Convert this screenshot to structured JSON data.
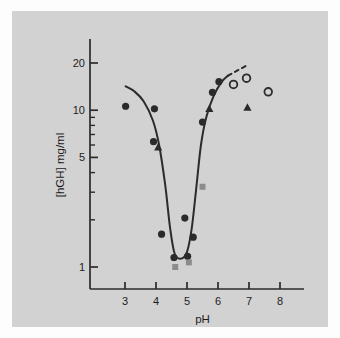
{
  "figure": {
    "background_color": "#fdfdfd",
    "panel_color": "#d2d2d2",
    "ink_color": "#2b2b2b"
  },
  "chart_data": {
    "type": "scatter",
    "title": "",
    "subtitle": "",
    "xlabel": "pH",
    "ylabel": "[hGH] mg/ml",
    "xlim": [
      2.6,
      8.4
    ],
    "ylim": [
      0.85,
      26
    ],
    "yscale": "log",
    "xscale": "linear",
    "grid": false,
    "legend_position": "none",
    "xticks": [
      3,
      4,
      5,
      6,
      7,
      8
    ],
    "xtick_labels": [
      "3",
      "4",
      "5",
      "6",
      "7",
      "8"
    ],
    "yticks": [
      1,
      2,
      3,
      4,
      5,
      6,
      7,
      8,
      9,
      10,
      20
    ],
    "ytick_labels_shown": [
      "1",
      "5",
      "10",
      "20"
    ],
    "series": [
      {
        "name": "filled-circle",
        "marker": "filled-circle",
        "color": "#2b2b2b",
        "points": [
          {
            "x": 3.02,
            "y": 10.6
          },
          {
            "x": 3.95,
            "y": 10.2
          },
          {
            "x": 3.92,
            "y": 6.3
          },
          {
            "x": 4.18,
            "y": 1.62
          },
          {
            "x": 4.58,
            "y": 1.15
          },
          {
            "x": 4.93,
            "y": 2.05
          },
          {
            "x": 5.02,
            "y": 1.17
          },
          {
            "x": 5.2,
            "y": 1.55
          },
          {
            "x": 5.5,
            "y": 8.4
          },
          {
            "x": 5.82,
            "y": 13.0
          },
          {
            "x": 6.03,
            "y": 15.2
          }
        ]
      },
      {
        "name": "filled-triangle",
        "marker": "filled-triangle",
        "color": "#2b2b2b",
        "points": [
          {
            "x": 4.07,
            "y": 5.8
          },
          {
            "x": 5.72,
            "y": 10.2
          },
          {
            "x": 6.95,
            "y": 10.4
          }
        ]
      },
      {
        "name": "open-circle",
        "marker": "open-circle",
        "color": "#2b2b2b",
        "points": [
          {
            "x": 6.5,
            "y": 14.6
          },
          {
            "x": 6.92,
            "y": 16.0
          },
          {
            "x": 7.62,
            "y": 13.1
          }
        ]
      },
      {
        "name": "gray-square",
        "marker": "filled-square",
        "color": "#8c8c8c",
        "points": [
          {
            "x": 5.5,
            "y": 3.25
          },
          {
            "x": 5.06,
            "y": 1.07
          },
          {
            "x": 4.62,
            "y": 1.0
          }
        ]
      }
    ],
    "curve": {
      "name": "fitted-solubility-curve",
      "style": "solid",
      "color": "#2b2b2b",
      "points": [
        {
          "x": 3.02,
          "y": 14.2
        },
        {
          "x": 3.3,
          "y": 13.2
        },
        {
          "x": 3.6,
          "y": 11.4
        },
        {
          "x": 3.9,
          "y": 8.6
        },
        {
          "x": 4.1,
          "y": 6.0
        },
        {
          "x": 4.3,
          "y": 3.3
        },
        {
          "x": 4.45,
          "y": 1.8
        },
        {
          "x": 4.6,
          "y": 1.22
        },
        {
          "x": 4.8,
          "y": 1.13
        },
        {
          "x": 5.0,
          "y": 1.25
        },
        {
          "x": 5.15,
          "y": 1.75
        },
        {
          "x": 5.3,
          "y": 3.2
        },
        {
          "x": 5.45,
          "y": 6.0
        },
        {
          "x": 5.62,
          "y": 9.0
        },
        {
          "x": 5.85,
          "y": 12.2
        },
        {
          "x": 6.1,
          "y": 15.0
        },
        {
          "x": 6.32,
          "y": 16.6
        }
      ]
    },
    "dashed_extension": {
      "name": "dashed-extrapolation",
      "style": "dashed",
      "color": "#2b2b2b",
      "points": [
        {
          "x": 6.32,
          "y": 16.6
        },
        {
          "x": 6.95,
          "y": 19.4
        }
      ]
    }
  }
}
